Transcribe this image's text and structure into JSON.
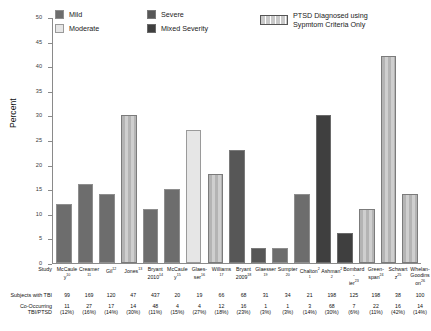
{
  "legend": {
    "items": [
      {
        "label": "Mild",
        "swatch": "mild-swatch",
        "color": "#6d6d6d"
      },
      {
        "label": "Moderate",
        "swatch": "moderate-swatch",
        "color": "#e6e6e6"
      },
      {
        "label": "Severe",
        "swatch": "severe-swatch",
        "color": "#575757"
      },
      {
        "label": "Mixed Severity",
        "swatch": "mixed-severity-swatch",
        "color": "#3f3f3f"
      }
    ],
    "ptsd_line1": "PTSD Diagnosed using",
    "ptsd_line2": "Sypmtom Criteria Only"
  },
  "table": {
    "row_labels": {
      "study": "Study",
      "subjects": "Subjects with TBI",
      "cooccur_line1": "Co-Occurring",
      "cooccur_line2": "TBI/PTSD"
    }
  },
  "chart_data": {
    "type": "bar",
    "title": "",
    "xlabel": "",
    "ylabel": "Percent",
    "ylim": [
      0,
      50
    ],
    "yticks": [
      0,
      5,
      10,
      15,
      20,
      25,
      30,
      35,
      40,
      45,
      50
    ],
    "ytick_labels": [
      "0",
      "5",
      "10",
      "15",
      "20",
      "25",
      "30",
      "35",
      "40",
      "45",
      "50"
    ],
    "grid": false,
    "legend_position": "top",
    "categories": [
      "McCauley¹⁰",
      "Creamer¹¹",
      "Gil¹²",
      "Jones¹³",
      "Bryant 2010¹⁴",
      "McCauley¹⁵",
      "Glaesser¹⁶",
      "Williams¹⁷",
      "Bryant 2009¹⁸",
      "Glaesser¹⁹",
      "Sumpter²⁰",
      "Chalton²¹",
      "Ashman²²",
      "Bombardier²³",
      "Greenspan²⁴",
      "Schwartz²⁵",
      "Whelan-Goodinson²⁶"
    ],
    "category_lines": [
      [
        "McCauley",
        "10"
      ],
      [
        "Creamer",
        "11"
      ],
      [
        "Gil",
        "12"
      ],
      [
        "Jones",
        "13"
      ],
      [
        "Bryant",
        "2010",
        "14"
      ],
      [
        "McCauley",
        "15"
      ],
      [
        "Glaes-",
        "ser",
        "16"
      ],
      [
        "Williams",
        "17"
      ],
      [
        "Bryant",
        "2009",
        "18"
      ],
      [
        "Glaesser",
        "19"
      ],
      [
        "Sumpter",
        "20"
      ],
      [
        "Chalton",
        "21"
      ],
      [
        "Ashman",
        "22"
      ],
      [
        "Bombard-",
        "ier",
        "23"
      ],
      [
        "Green-",
        "span",
        "24"
      ],
      [
        "Schwartz",
        "25"
      ],
      [
        "Whelan-",
        "Goodinson",
        "26"
      ]
    ],
    "values": [
      12,
      16,
      14,
      30,
      11,
      15,
      27,
      18,
      23,
      3,
      3,
      14,
      30,
      6,
      11,
      42,
      14
    ],
    "series_category": [
      "mild",
      "mild",
      "mild",
      "hatch",
      "mild",
      "mild",
      "moderate",
      "hatch",
      "severe",
      "severe",
      "mild",
      "mild",
      "mixed",
      "mixed",
      "hatch",
      "hatch",
      "hatch"
    ],
    "subjects_with_tbi": [
      "99",
      "169",
      "120",
      "47",
      "437",
      "20",
      "19",
      "66",
      "68",
      "31",
      "34",
      "21",
      "198",
      "125",
      "198",
      "38",
      "100"
    ],
    "cooccurring_n": [
      "11",
      "27",
      "17",
      "14",
      "48",
      "4",
      "4",
      "12",
      "16",
      "1",
      "1",
      "3",
      "68",
      "7",
      "22",
      "16",
      "14"
    ],
    "cooccurring_pct": [
      "(12%)",
      "(16%)",
      "(14%)",
      "(30%)",
      "(11%)",
      "(15%)",
      "(27%)",
      "(18%)",
      "(23%)",
      "(3%)",
      "(3%)",
      "(14%)",
      "(30%)",
      "(6%)",
      "(11%)",
      "(42%)",
      "(14%)"
    ]
  }
}
